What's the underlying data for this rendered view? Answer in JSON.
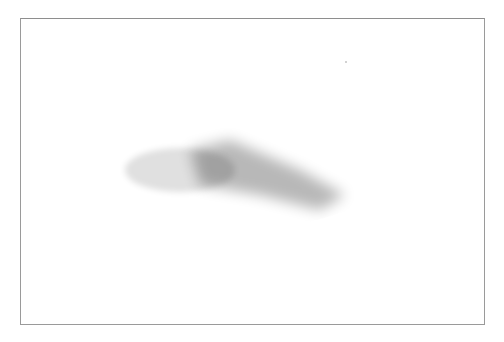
{
  "figure": {
    "kind": "checker-shadow illusion",
    "board": {
      "size": 6,
      "origin": [
        298,
        82
      ],
      "u_step": [
        21.67,
        17.67
      ],
      "v_step": [
        -36.67,
        10.67
      ],
      "light_color": "#eeeeee",
      "dark_color": "#a6a6a6"
    },
    "cylinder": {
      "cx": 168.5,
      "top_cy": 55,
      "bottom_cy": 159,
      "rx": 52.5,
      "ry": 26,
      "top_color": "#f2f2f2",
      "side_light": "#f0f0f0",
      "side_dark": "#c8c8c8"
    },
    "frame_color": "#9a9a9a"
  },
  "swatches": [
    {
      "label": "A",
      "color": "#f3f3f3",
      "x": 79
    },
    {
      "label": "B",
      "color": "#a9a9a9",
      "x": 119
    },
    {
      "label": "C",
      "color": "#8b8b8b",
      "x": 159
    }
  ]
}
